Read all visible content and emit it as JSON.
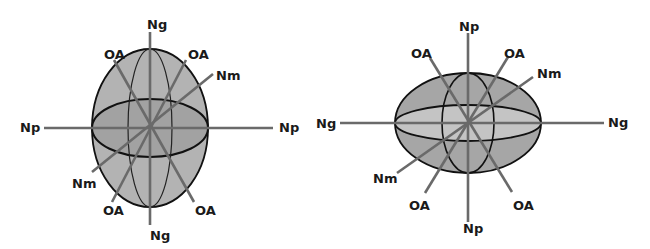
{
  "colors": {
    "background": "#ffffff",
    "body_fill": "#b3b3b3",
    "left_inner_fill": "#a2a2a2",
    "right_outer_fill": "#a6a6a6",
    "right_inner_fill": "#c4c4c4",
    "axis_line": "#6a6a6a",
    "outline": "#111111",
    "label": "#1a1a1a"
  },
  "figures": [
    {
      "id": "prolate",
      "description": "Vertically elongated indicatrix ellipsoid",
      "center": [
        150,
        128
      ],
      "labels": {
        "top": "Ng",
        "bottom": "Ng",
        "left": "Np",
        "right": "Np",
        "oa_upper_left": "OA",
        "oa_upper_right": "OA",
        "oa_lower_left": "OA",
        "oa_lower_right": "OA",
        "nm_upper": "Nm",
        "nm_lower": "Nm"
      }
    },
    {
      "id": "oblate",
      "description": "Horizontally elongated indicatrix ellipsoid",
      "center": [
        468,
        123
      ],
      "labels": {
        "top": "Np",
        "bottom": "Np",
        "left": "Ng",
        "right": "Ng",
        "oa_upper_left": "OA",
        "oa_upper_right": "OA",
        "oa_lower_left": "OA",
        "oa_lower_right": "OA",
        "nm_upper": "Nm",
        "nm_lower": "Nm"
      }
    }
  ]
}
